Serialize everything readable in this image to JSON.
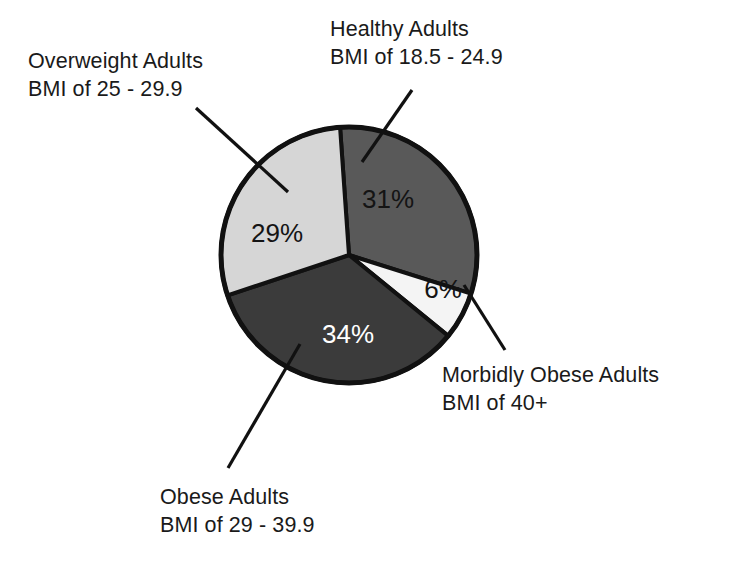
{
  "chart_data": {
    "type": "pie",
    "title": "",
    "subtitle": "",
    "xlabel": "",
    "ylabel": "",
    "legend_position": "callout-labels",
    "grid": false,
    "total": 100,
    "units": "percent",
    "categories": [
      "Healthy Adults",
      "Morbidly Obese Adults",
      "Obese Adults",
      "Overweight Adults"
    ],
    "values": [
      31,
      6,
      34,
      29
    ],
    "slices": [
      {
        "id": "healthy",
        "category": "Healthy Adults",
        "criteria": "BMI of 18.5 - 24.9",
        "value": 31,
        "value_label": "31%",
        "fill": "#595959",
        "text_color": "#141414",
        "start_angle_deg": -4,
        "end_angle_deg": 107.6
      },
      {
        "id": "morbid",
        "category": "Morbidly Obese Adults",
        "criteria": "BMI of 40+",
        "value": 6,
        "value_label": "6%",
        "fill": "#f4f4f4",
        "text_color": "#141414",
        "start_angle_deg": 107.6,
        "end_angle_deg": 129.2
      },
      {
        "id": "obese",
        "category": "Obese Adults",
        "criteria": "BMI of 29 - 39.9",
        "value": 34,
        "value_label": "34%",
        "fill": "#3b3b3b",
        "text_color": "#ffffff",
        "start_angle_deg": 129.2,
        "end_angle_deg": 251.6
      },
      {
        "id": "overweight",
        "category": "Overweight Adults",
        "criteria": "BMI of 25 - 29.9",
        "value": 29,
        "value_label": "29%",
        "fill": "#d6d6d6",
        "text_color": "#141414",
        "start_angle_deg": 251.6,
        "end_angle_deg": 356
      }
    ],
    "annotations": [
      "Overweight Adults BMI of 25 - 29.9",
      "Healthy Adults BMI of 18.5 - 24.9",
      "Morbidly Obese Adults BMI of 40+",
      "Obese Adults BMI of 29 - 39.9"
    ]
  },
  "labels": {
    "overweight": {
      "line1": "Overweight Adults",
      "line2": "BMI of 25 - 29.9"
    },
    "healthy": {
      "line1": "Healthy Adults",
      "line2": "BMI of 18.5 - 24.9"
    },
    "morbid": {
      "line1": "Morbidly Obese Adults",
      "line2": "BMI of 40+"
    },
    "obese": {
      "line1": "Obese Adults",
      "line2": "BMI of 29 - 39.9"
    }
  },
  "values": {
    "healthy": "31%",
    "morbid": "6%",
    "obese": "34%",
    "overweight": "29%"
  },
  "colors": {
    "background": "#ffffff",
    "outline": "#111111",
    "text": "#1a1a1a",
    "slice_healthy": "#595959",
    "slice_morbid": "#f4f4f4",
    "slice_obese": "#3b3b3b",
    "slice_overweight": "#d6d6d6"
  }
}
